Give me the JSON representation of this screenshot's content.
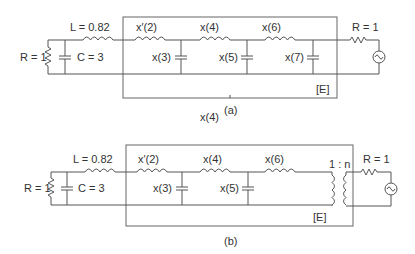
{
  "figure": {
    "panels": [
      {
        "id": "a",
        "caption": "(a)",
        "left_network": {
          "resistor_label": "R = 1",
          "capacitor_label": "C = 3",
          "inductor_label": "L = 0.82"
        },
        "box_elements": {
          "series_1": "x′(2)",
          "shunt_1": "x(3)",
          "series_2": "x(4)",
          "shunt_2": "x(5)",
          "series_3": "x(6)",
          "shunt_3": "x(7)"
        },
        "box_label": "[E]",
        "source_resistor_label": "R = 1",
        "below_label": "x(4)"
      },
      {
        "id": "b",
        "caption": "(b)",
        "left_network": {
          "resistor_label": "R = 1",
          "capacitor_label": "C = 3",
          "inductor_label": "L = 0.82"
        },
        "box_elements": {
          "series_1": "x′(2)",
          "shunt_1": "x(3)",
          "series_2": "x(4)",
          "shunt_2": "x(5)",
          "series_3": "x(6)",
          "transformer_ratio": "1 : n"
        },
        "box_label": "[E]",
        "source_resistor_label": "R = 1"
      }
    ]
  },
  "text": {
    "a_L": "L = 0.82",
    "a_R": "R = 1",
    "a_C": "C = 3",
    "a_x2": "x′(2)",
    "a_x3": "x(3)",
    "a_x4": "x(4)",
    "a_x5": "x(5)",
    "a_x6": "x(6)",
    "a_x7": "x(7)",
    "a_E": "[E]",
    "a_Rs": "R = 1",
    "a_cap": "(a)",
    "a_below": "x(4)",
    "b_L": "L = 0.82",
    "b_R": "R = 1",
    "b_C": "C = 3",
    "b_x2": "x′(2)",
    "b_x3": "x(3)",
    "b_x4": "x(4)",
    "b_x5": "x(5)",
    "b_x6": "x(6)",
    "b_ratio": "1 : n",
    "b_E": "[E]",
    "b_Rs": "R = 1",
    "b_cap": "(b)"
  }
}
